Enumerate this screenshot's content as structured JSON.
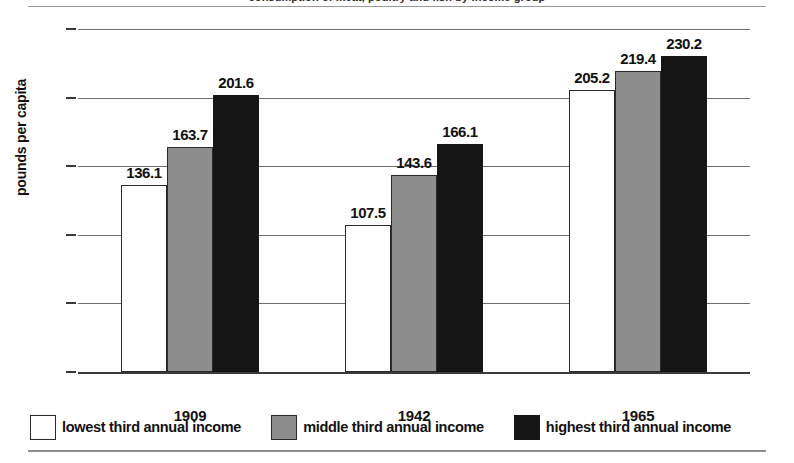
{
  "figure": {
    "clipped_title": "consumption of meat, poultry and fish by income group",
    "axis_title_y": "pounds per capita"
  },
  "chart_data": {
    "type": "bar",
    "title": "",
    "xlabel": "",
    "ylabel": "pounds per capita",
    "categories": [
      "1909",
      "1942",
      "1965"
    ],
    "ylim": [
      0,
      250
    ],
    "yticks": [
      0,
      50,
      100,
      150,
      200,
      250
    ],
    "ytick_labels": [
      "0",
      "50",
      "100",
      "150",
      "200",
      "250"
    ],
    "grid": true,
    "legend_position": "bottom",
    "series": [
      {
        "name": "lowest third annual income",
        "color": "#ffffff",
        "values": [
          136.1,
          107.5,
          205.2
        ],
        "labels": [
          "136.1",
          "107.5",
          "205.2"
        ]
      },
      {
        "name": "middle third annual income",
        "color": "#8d8d8d",
        "values": [
          163.7,
          143.6,
          219.4
        ],
        "labels": [
          "163.7",
          "143.6",
          "219.4"
        ]
      },
      {
        "name": "highest third annual income",
        "color": "#151515",
        "values": [
          201.6,
          166.1,
          230.2
        ],
        "labels": [
          "201.6",
          "166.1",
          "230.2"
        ]
      }
    ]
  },
  "legend": {
    "items": [
      {
        "label": "lowest third annual income",
        "swatch": "low"
      },
      {
        "label": "middle third annual income",
        "swatch": "mid"
      },
      {
        "label": "highest third annual income",
        "swatch": "high"
      }
    ]
  }
}
